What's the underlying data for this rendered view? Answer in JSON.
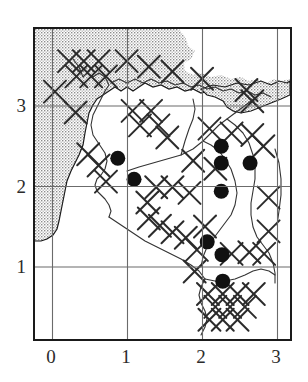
{
  "figure": {
    "kind": "distribution-map",
    "background_color": "#ffffff",
    "frame_color": "#1a1a1a",
    "grid_color": "#6b6b6b",
    "sea_fill_color": "#b5b5b5",
    "sea_outline_color": "#1a1a1a",
    "coastline_color": "#3a3a3a",
    "cross_color": "#2b2b2b",
    "dot_color": "#111111"
  },
  "axes": {
    "x": {
      "label": "",
      "ticks": [
        "0",
        "1",
        "2",
        "3"
      ],
      "values": [
        0,
        1,
        2,
        3
      ],
      "range": [
        -0.24,
        3.21
      ],
      "grid": true
    },
    "y": {
      "label": "",
      "ticks": [
        "3",
        "2",
        "1"
      ],
      "values": [
        3,
        2,
        1
      ],
      "range": [
        0.06,
        3.92
      ],
      "grid": true
    }
  },
  "chart_data": {
    "type": "scatter",
    "title": "",
    "subtitle": "",
    "xlabel": "",
    "ylabel": "",
    "xlim": [
      -0.24,
      3.21
    ],
    "ylim": [
      0.06,
      3.92
    ],
    "grid": true,
    "legend": "none",
    "series": [
      {
        "name": "records",
        "marker": "filled-circle",
        "color": "#111111",
        "points": [
          {
            "x": 0.88,
            "y": 2.31
          },
          {
            "x": 1.1,
            "y": 2.05
          },
          {
            "x": 2.28,
            "y": 2.46
          },
          {
            "x": 2.28,
            "y": 2.25
          },
          {
            "x": 2.67,
            "y": 2.25
          },
          {
            "x": 2.28,
            "y": 1.9
          },
          {
            "x": 2.09,
            "y": 1.27
          },
          {
            "x": 2.29,
            "y": 1.11
          },
          {
            "x": 2.3,
            "y": 0.78
          }
        ]
      },
      {
        "name": "grid-squares",
        "marker": "saltire-cross",
        "color": "#2b2b2b",
        "points": [
          {
            "x": 0.03,
            "y": 3.14
          },
          {
            "x": 0.22,
            "y": 3.52
          },
          {
            "x": 0.42,
            "y": 3.52
          },
          {
            "x": 0.32,
            "y": 3.33
          },
          {
            "x": 0.52,
            "y": 3.33
          },
          {
            "x": 0.62,
            "y": 3.52
          },
          {
            "x": 0.72,
            "y": 3.33
          },
          {
            "x": 1.0,
            "y": 3.52
          },
          {
            "x": 1.3,
            "y": 3.45
          },
          {
            "x": 1.62,
            "y": 3.39
          },
          {
            "x": 2.02,
            "y": 3.3
          },
          {
            "x": 2.62,
            "y": 3.16
          },
          {
            "x": 2.7,
            "y": 3.02
          },
          {
            "x": 0.31,
            "y": 2.88
          },
          {
            "x": 1.08,
            "y": 2.9
          },
          {
            "x": 1.33,
            "y": 2.9
          },
          {
            "x": 1.18,
            "y": 2.72
          },
          {
            "x": 1.43,
            "y": 2.72
          },
          {
            "x": 1.55,
            "y": 2.57
          },
          {
            "x": 2.12,
            "y": 2.68
          },
          {
            "x": 2.42,
            "y": 2.62
          },
          {
            "x": 2.7,
            "y": 2.6
          },
          {
            "x": 2.85,
            "y": 2.46
          },
          {
            "x": 0.48,
            "y": 2.36
          },
          {
            "x": 0.62,
            "y": 2.22
          },
          {
            "x": 1.9,
            "y": 2.28
          },
          {
            "x": 2.2,
            "y": 2.18
          },
          {
            "x": 0.72,
            "y": 2.02
          },
          {
            "x": 1.4,
            "y": 1.95
          },
          {
            "x": 1.62,
            "y": 1.95
          },
          {
            "x": 1.85,
            "y": 1.88
          },
          {
            "x": 2.92,
            "y": 1.82
          },
          {
            "x": 1.28,
            "y": 1.76
          },
          {
            "x": 1.3,
            "y": 1.56
          },
          {
            "x": 1.45,
            "y": 1.47
          },
          {
            "x": 1.62,
            "y": 1.39
          },
          {
            "x": 1.8,
            "y": 1.32
          },
          {
            "x": 2.92,
            "y": 1.4
          },
          {
            "x": 2.06,
            "y": 1.46
          },
          {
            "x": 1.95,
            "y": 1.17
          },
          {
            "x": 2.42,
            "y": 1.12
          },
          {
            "x": 2.66,
            "y": 1.14
          },
          {
            "x": 2.86,
            "y": 1.12
          },
          {
            "x": 1.92,
            "y": 0.9
          },
          {
            "x": 2.1,
            "y": 0.62
          },
          {
            "x": 2.3,
            "y": 0.62
          },
          {
            "x": 2.5,
            "y": 0.62
          },
          {
            "x": 2.2,
            "y": 0.46
          },
          {
            "x": 2.4,
            "y": 0.46
          },
          {
            "x": 2.6,
            "y": 0.46
          },
          {
            "x": 2.3,
            "y": 0.3
          },
          {
            "x": 2.5,
            "y": 0.3
          },
          {
            "x": 2.72,
            "y": 0.62
          },
          {
            "x": 2.12,
            "y": 0.3
          }
        ]
      }
    ]
  }
}
